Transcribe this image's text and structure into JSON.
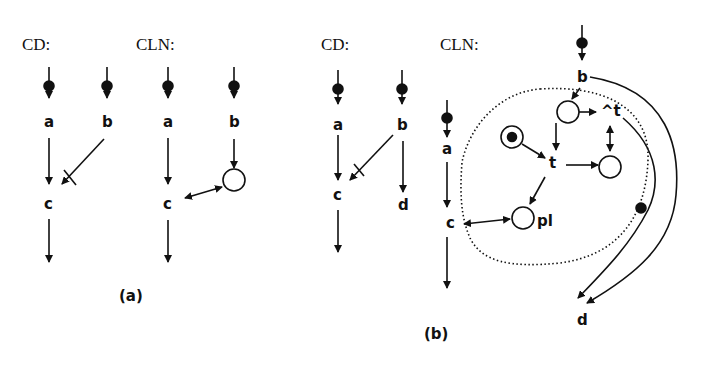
{
  "figure_a": {
    "caption": "(a)",
    "cd": {
      "title": "CD:",
      "nodes": {
        "a": "a",
        "b": "b",
        "c": "c"
      }
    },
    "cln": {
      "title": "CLN:",
      "nodes": {
        "a": "a",
        "b": "b",
        "c": "c"
      }
    }
  },
  "figure_b": {
    "caption": "(b)",
    "cd": {
      "title": "CD:",
      "nodes": {
        "a": "a",
        "b": "b",
        "c": "c",
        "d": "d"
      }
    },
    "cln": {
      "title": "CLN:",
      "nodes": {
        "a": "a",
        "b": "b",
        "c": "c",
        "d": "d",
        "t": "t",
        "not_t": "^t",
        "pl": "pl"
      }
    }
  },
  "colors": {
    "ink": "#111111",
    "background": "#ffffff"
  }
}
